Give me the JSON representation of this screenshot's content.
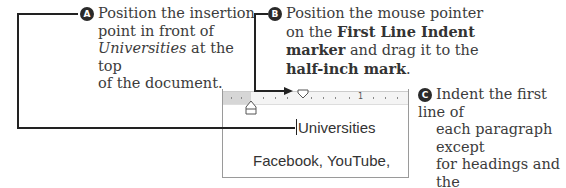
{
  "callouts": [
    {
      "badge": "A",
      "lines": [
        "Position the insertion",
        "point in front of",
        "Universities",
        " at the top",
        "of the document."
      ]
    },
    {
      "badge": "B",
      "line1": "Position the mouse pointer",
      "line2_pre": "on the ",
      "line2_bold": "First Line Indent",
      "line3_bold": "marker",
      "line3_post": " and drag it to the",
      "line4_bold": "half-inch mark",
      "line4_post": "."
    },
    {
      "badge": "C",
      "lines": [
        "Indent the first line of",
        "each paragraph except",
        "for headings and the",
        "quotations."
      ]
    }
  ],
  "screenshot": {
    "ruler_label": "1",
    "doc_line1": "Universities",
    "doc_line2": "Facebook, YouTube,"
  }
}
